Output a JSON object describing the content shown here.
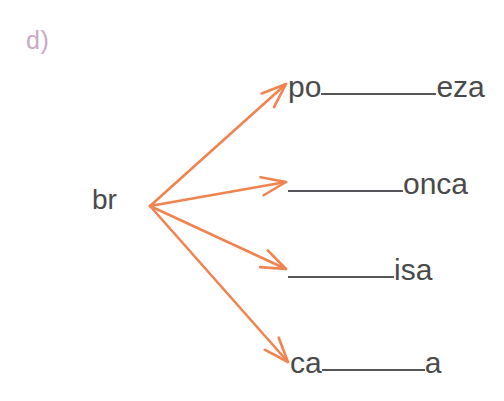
{
  "exercise": {
    "label": "d)",
    "label_color": "#c9a8c4",
    "root": "br",
    "root_color": "#4a4a4a",
    "arrow_color": "#f0834f"
  },
  "branches": [
    {
      "id": "branch-1",
      "prefix": "po",
      "suffix": "eza",
      "blank": "________",
      "answer_blank_width": "wide"
    },
    {
      "id": "branch-2",
      "prefix": "",
      "suffix": "onca",
      "blank": "________",
      "answer_blank_width": "wide"
    },
    {
      "id": "branch-3",
      "prefix": "",
      "suffix": "isa",
      "blank": "________",
      "answer_blank_width": "mid"
    },
    {
      "id": "branch-4",
      "prefix": "ca",
      "suffix": "a",
      "blank": "________",
      "answer_blank_width": "short"
    }
  ],
  "arrows": [
    {
      "id": "arrow-1",
      "from_x": 150,
      "from_y": 206,
      "to_x": 286,
      "to_y": 84
    },
    {
      "id": "arrow-2",
      "from_x": 150,
      "from_y": 206,
      "to_x": 286,
      "to_y": 182
    },
    {
      "id": "arrow-3",
      "from_x": 150,
      "from_y": 206,
      "to_x": 286,
      "to_y": 269
    },
    {
      "id": "arrow-4",
      "from_x": 150,
      "from_y": 206,
      "to_x": 288,
      "to_y": 362
    }
  ]
}
